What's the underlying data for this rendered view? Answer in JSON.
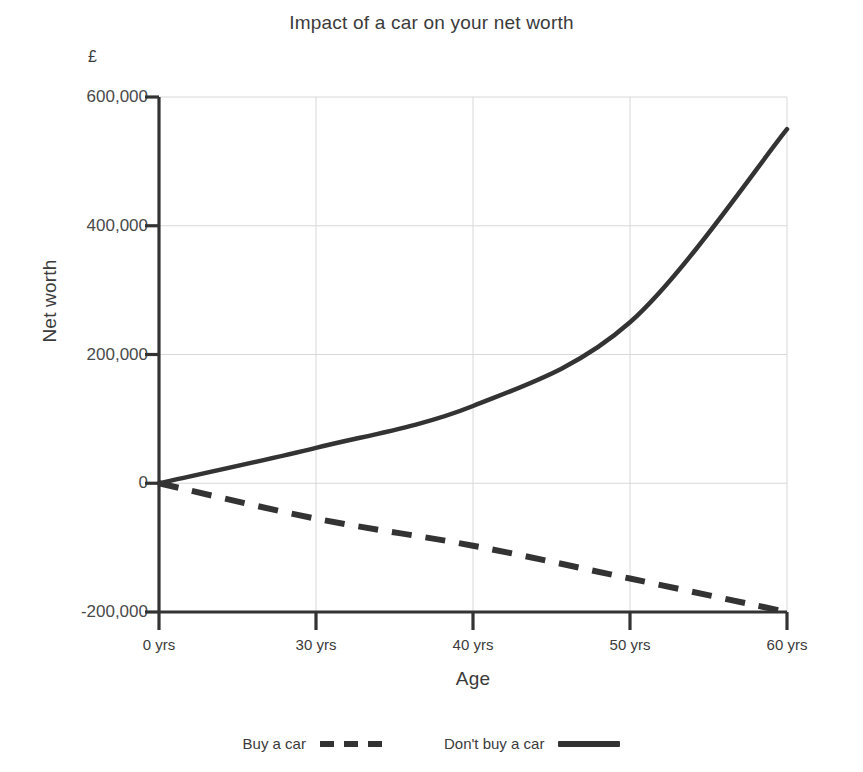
{
  "chart_data": {
    "type": "line",
    "title": "Impact of a car on your net worth",
    "xlabel": "Age",
    "ylabel": "Net worth",
    "y_unit": "£",
    "grid": true,
    "legend_position": "bottom",
    "xlim": [
      0,
      60
    ],
    "ylim": [
      -200000,
      600000
    ],
    "x_tick_labels": [
      "0 yrs",
      "30 yrs",
      "40 yrs",
      "50 yrs",
      "60 yrs"
    ],
    "x_tick_values": [
      0,
      30,
      40,
      50,
      60
    ],
    "y_tick_labels": [
      "600,000",
      "400,000",
      "200,000",
      "0",
      "-200,000"
    ],
    "y_tick_values": [
      600000,
      400000,
      200000,
      0,
      -200000
    ],
    "x": [
      0,
      30,
      40,
      50,
      60
    ],
    "series": [
      {
        "name": "Buy a car",
        "style": "dashed",
        "color": "#333333",
        "values": [
          0,
          -55000,
          -97000,
          -148000,
          -200000
        ]
      },
      {
        "name": "Don't buy a car",
        "style": "solid",
        "color": "#333333",
        "values": [
          0,
          55000,
          120000,
          250000,
          550000
        ]
      }
    ]
  },
  "chart": {
    "title": "Impact of a car on your net worth",
    "y_unit": "£",
    "y_axis_title": "Net worth",
    "x_axis_title": "Age",
    "y_ticks": [
      {
        "label": "600,000",
        "value": 600000
      },
      {
        "label": "400,000",
        "value": 400000
      },
      {
        "label": "200,000",
        "value": 200000
      },
      {
        "label": "0",
        "value": 0
      },
      {
        "label": "-200,000",
        "value": -200000
      }
    ],
    "x_ticks": [
      {
        "label": "0 yrs",
        "value": 0
      },
      {
        "label": "30 yrs",
        "value": 30
      },
      {
        "label": "40 yrs",
        "value": 40
      },
      {
        "label": "50 yrs",
        "value": 50
      },
      {
        "label": "60 yrs",
        "value": 60
      }
    ],
    "legend": [
      {
        "label": "Buy a car",
        "style": "dashed"
      },
      {
        "label": "Don't buy a car",
        "style": "solid"
      }
    ],
    "colors": {
      "line": "#333333",
      "axis": "#333333",
      "grid": "#d8d8d8",
      "text": "#3b3b3b",
      "background": "#ffffff"
    }
  }
}
